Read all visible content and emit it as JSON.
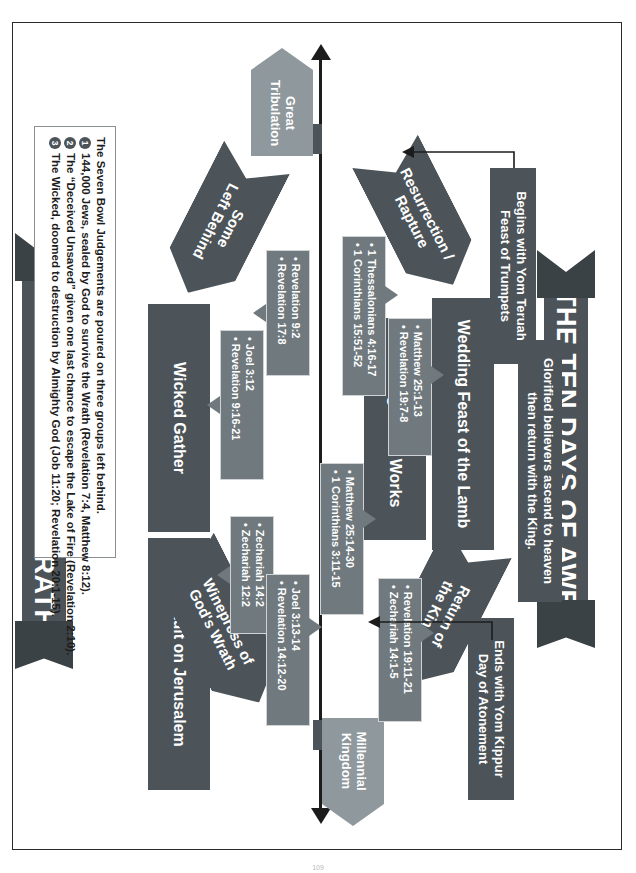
{
  "diagram": {
    "title_left_banner": "THE TEN DAYS OF AWE",
    "title_right_banner": "THE TEN DAYS OF WRATH",
    "endpoints": {
      "top": "Millennial Kingdom",
      "bottom_line1": "Great",
      "bottom_line2": "Tribulation"
    },
    "left_track": {
      "notes": [
        {
          "name": "ends-note",
          "line1": "Ends with Yom Kippur",
          "line2": "Day of Atonement"
        },
        {
          "name": "glorified-note",
          "line1": "Glorified believers ascend to heaven",
          "line2": "then return with the King."
        },
        {
          "name": "begins-note",
          "line1": "Begins with Yom Teruah",
          "line2": "Feast of Trumpets"
        }
      ],
      "stages": [
        {
          "name": "return-of-the-king",
          "line1": "Return of",
          "line2": "the King"
        },
        {
          "name": "testing-of-the-works",
          "line1": "Testing of the Works",
          "line2": ""
        },
        {
          "name": "wedding-feast-of-the-lamb",
          "line1": "Wedding Feast of the Lamb",
          "line2": ""
        },
        {
          "name": "resurrection-rapture",
          "line1": "Resurrection /",
          "line2": "Rapture"
        }
      ],
      "refs": [
        {
          "name": "refs-return-of-the-king",
          "items": [
            "Revelation 19:11-21",
            "Zechariah 14:1-5"
          ]
        },
        {
          "name": "refs-testing-of-the-works",
          "items": [
            "Matthew 25:14-30",
            "1 Corinthians 3:11-15"
          ]
        },
        {
          "name": "refs-wedding-feast",
          "items": [
            "Matthew 25:1-13",
            "Revelation 19:7-8"
          ]
        },
        {
          "name": "refs-resurrection-rapture",
          "items": [
            "1 Thessalonians 4:16-17",
            "1 Corinthians 15:51-52"
          ]
        }
      ]
    },
    "right_track": {
      "stages": [
        {
          "name": "winepress-of-gods-wrath",
          "line1": "Winepress of",
          "line2": "God's Wrath"
        },
        {
          "name": "assault-on-jerusalem",
          "line1": "Assault on Jerusalem",
          "line2": ""
        },
        {
          "name": "wicked-gather",
          "line1": "Wicked Gather",
          "line2": ""
        },
        {
          "name": "some-left-behind",
          "line1": "Some",
          "line2": "Left Behind"
        }
      ],
      "refs": [
        {
          "name": "refs-winepress",
          "items": [
            "Joel 3:13-14",
            "Revelation 14:12-20"
          ]
        },
        {
          "name": "refs-assault-on-jerusalem",
          "items": [
            "Zechariah 14:2",
            "Zechariah 12:2"
          ]
        },
        {
          "name": "refs-wicked-gather",
          "items": [
            "Joel 3:12",
            "Revelation 9:16-21"
          ]
        },
        {
          "name": "refs-some-left-behind",
          "items": [
            "Revelation 9:2",
            "Revelation 17:8"
          ]
        }
      ]
    },
    "legend": {
      "intro": "The Seven Bowl Judgements are poured on three groups left behind.",
      "items": [
        {
          "num": "1",
          "text": "144,000 Jews, sealed by God to survive the Wrath (Revelation 7:4, Matthew 8:12)."
        },
        {
          "num": "2",
          "text": "The “Deceived Unsaved” given one last chance to escape the Lake of Fire (Revelation 2:10)."
        },
        {
          "num": "3",
          "text": "The Wicked, doomed to destruction by Almighty God (Job 11:20; Revelation 20:1-15)."
        }
      ]
    },
    "colors": {
      "dark": "#4c5459",
      "light": "#8e989d",
      "bubble": "#6f797e",
      "ink": "#1c1c1c"
    },
    "page_number": "109"
  }
}
